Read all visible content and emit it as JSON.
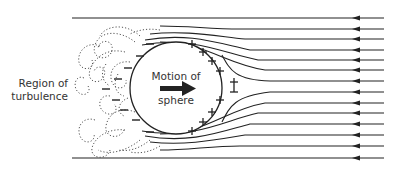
{
  "diagram": {
    "labels": {
      "region_line1": "Region of",
      "region_line2": "turbulence",
      "motion_line1": "Motion of",
      "motion_line2": "sphere"
    },
    "symbols": {
      "positive": "+",
      "negative": "−"
    },
    "colors": {
      "stroke": "#222222",
      "dotted": "#555555",
      "background": "#ffffff"
    },
    "streamline_count": 14,
    "flow_direction": "right-to-left",
    "sphere_motion": "left-to-right"
  }
}
